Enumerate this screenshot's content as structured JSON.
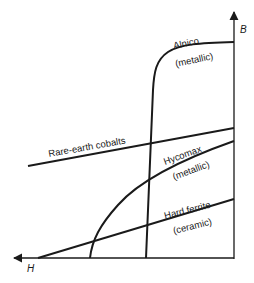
{
  "diagram": {
    "axes": {
      "x_label": "H",
      "y_label": "B"
    },
    "curves": [
      {
        "name": "Alnico",
        "sub": "(metallic)"
      },
      {
        "name": "Rare-earth cobalts",
        "sub": ""
      },
      {
        "name": "Hycomax",
        "sub": "(metallic)"
      },
      {
        "name": "Hard ferrite",
        "sub": "(ceramic)"
      }
    ]
  },
  "colors": {
    "line": "#1a1a1a",
    "background": "#ffffff"
  }
}
